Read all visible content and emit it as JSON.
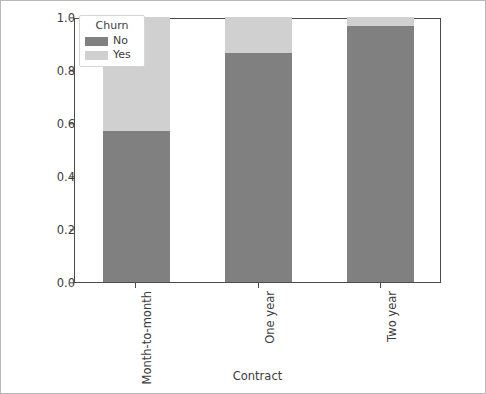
{
  "chart_data": {
    "type": "bar",
    "subtype": "stacked-proportional",
    "title": "",
    "xlabel": "Contract",
    "ylabel": "",
    "categories": [
      "Month-to-month",
      "One year",
      "Two year"
    ],
    "series": [
      {
        "name": "No",
        "color": "#808080",
        "values": [
          0.57,
          0.865,
          0.967
        ]
      },
      {
        "name": "Yes",
        "color": "#d0d0d0",
        "values": [
          0.43,
          0.135,
          0.033
        ]
      }
    ],
    "ylim": [
      0.0,
      1.0
    ],
    "yticks": [
      "0.0",
      "0.2",
      "0.4",
      "0.6",
      "0.8",
      "1.0"
    ],
    "ytick_values": [
      0.0,
      0.2,
      0.4,
      0.6,
      0.8,
      1.0
    ],
    "grid": false,
    "legend": {
      "title": "Churn",
      "position": "upper left",
      "entries": [
        "No",
        "Yes"
      ]
    },
    "xtick_rotation": 90
  },
  "figure": {
    "background": "#ffffff",
    "axes_edge_color": "#4a4a4a",
    "tick_label_color": "#3c3c3c",
    "border_color": "#b8b8b8"
  }
}
